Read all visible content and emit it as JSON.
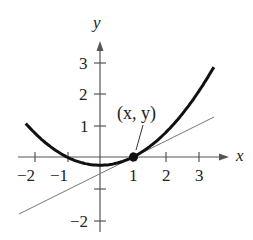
{
  "chart_data": {
    "type": "line",
    "title": "",
    "xlabel": "x",
    "ylabel": "y",
    "xlim": [
      -2.3,
      3.8
    ],
    "ylim": [
      -2.3,
      3.8
    ],
    "x_ticks": [
      "-2",
      "-1",
      "1",
      "2",
      "3"
    ],
    "y_ticks": [
      "3",
      "2",
      "1",
      "-2"
    ],
    "series": [
      {
        "name": "curve",
        "equation": "y = 0.25x^2 - 0.25",
        "style": "thick black",
        "x_range": [
          -2.2,
          3.45
        ]
      },
      {
        "name": "tangent line",
        "equation": "y = 0.5x - 0.5",
        "style": "thin gray",
        "x_range": [
          -2.45,
          3.45
        ]
      }
    ],
    "annotations": [
      {
        "text": "(x, y)",
        "point": [
          1,
          0
        ]
      }
    ],
    "grid": false
  },
  "labels": {
    "x_axis": "x",
    "y_axis": "y",
    "point": "(x, y)",
    "xt": [
      "−2",
      "−1",
      "1",
      "2",
      "3"
    ],
    "yt": [
      "3",
      "2",
      "1",
      "−2"
    ]
  }
}
